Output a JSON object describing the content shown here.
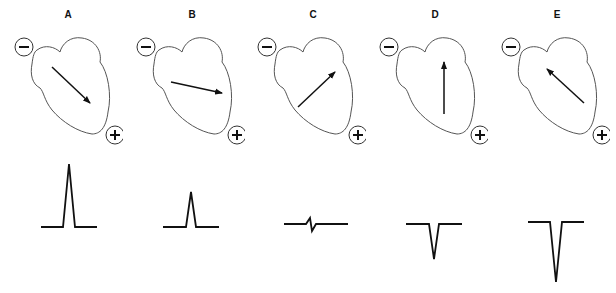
{
  "figure": {
    "panels": [
      {
        "label": "A",
        "vector_direction": "down-right",
        "vector_angle_deg": 45,
        "deflection": "tall positive",
        "amplitude": 63
      },
      {
        "label": "B",
        "vector_direction": "right, slightly down",
        "vector_angle_deg": 15,
        "deflection": "small positive",
        "amplitude": 35
      },
      {
        "label": "C",
        "vector_direction": "up-right",
        "vector_angle_deg": -45,
        "deflection": "equiphasic (isoelectric)",
        "amplitude": 8
      },
      {
        "label": "D",
        "vector_direction": "up",
        "vector_angle_deg": -90,
        "deflection": "negative",
        "amplitude": -35
      },
      {
        "label": "E",
        "vector_direction": "up-left",
        "vector_angle_deg": -135,
        "deflection": "deep negative",
        "amplitude": -60
      }
    ],
    "electrode_negative_symbol": "−",
    "electrode_positive_symbol": "+",
    "stroke_color": "#111111",
    "outline_color": "#555555"
  }
}
